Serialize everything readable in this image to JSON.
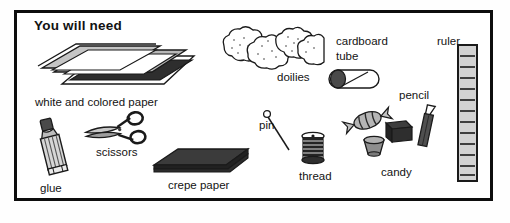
{
  "page": {
    "title": "You will need",
    "background_color": "#ffffff",
    "border_color": "#0d0d0d",
    "ink_color": "#131313"
  },
  "items": [
    {
      "id": "white-and-colored-paper",
      "label": "white and colored paper",
      "icon": "paper-stack-icon"
    },
    {
      "id": "doilies",
      "label": "doilies",
      "icon": "doilies-icon"
    },
    {
      "id": "cardboard-tube",
      "label_line1": "cardboard",
      "label_line2": "tube",
      "icon": "cardboard-tube-icon"
    },
    {
      "id": "ruler",
      "label": "ruler",
      "icon": "ruler-icon",
      "tick_count": 12
    },
    {
      "id": "pencil",
      "label": "pencil",
      "icon": "pencil-icon"
    },
    {
      "id": "pin",
      "label": "pin",
      "icon": "pin-icon"
    },
    {
      "id": "thread",
      "label": "thread",
      "icon": "thread-spool-icon"
    },
    {
      "id": "candy",
      "label": "candy",
      "icon": "candy-icon"
    },
    {
      "id": "glue",
      "label": "glue",
      "icon": "glue-tube-icon"
    },
    {
      "id": "scissors",
      "label": "scissors",
      "icon": "scissors-icon"
    },
    {
      "id": "crepe-paper",
      "label": "crepe paper",
      "icon": "crepe-paper-icon"
    }
  ],
  "colors": {
    "dark": "#2b2b2b",
    "mid_gray": "#9a9a9a",
    "light_gray": "#cfcfcf",
    "pale_gray": "#e3e3e3",
    "outline": "#1a1a1a"
  }
}
